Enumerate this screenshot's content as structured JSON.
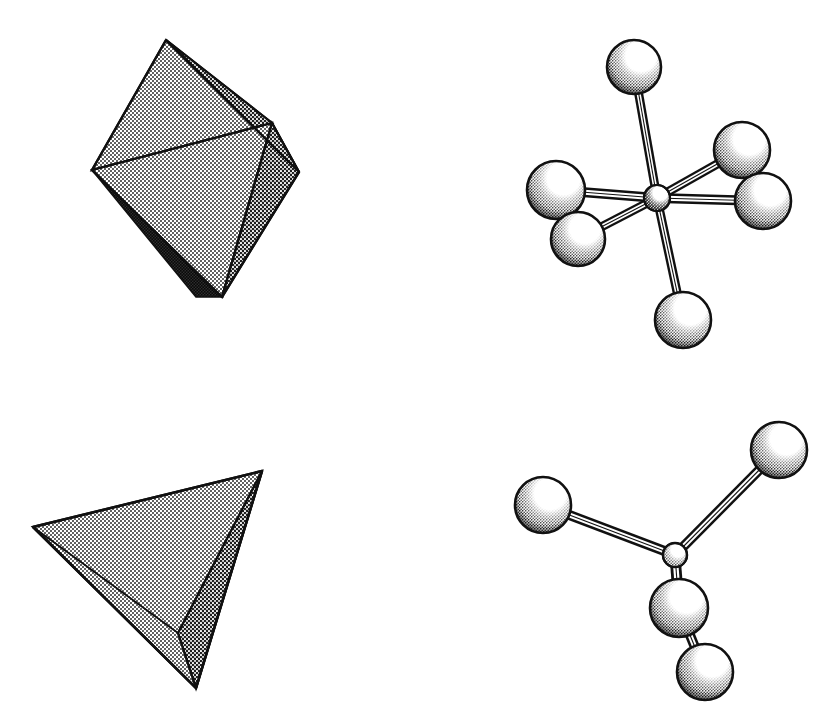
{
  "figure": {
    "background_color": "#ffffff",
    "ink_color": "#111111",
    "stipple_fill_color": "#9a9a9a",
    "light_face_color": "#bdbdbd",
    "mid_face_color": "#a6a6a6",
    "shadow_face_color": "#4a4a4a",
    "sphere_highlight_color": "#ffffff",
    "sphere_shade_color": "#8f8f8f",
    "sphere_dark_color": "#1a1a1a",
    "bond_color": "#ffffff",
    "panels": [
      {
        "id": "octahedron-solid",
        "label": "Octahedron polyhedron",
        "shape_type": "octahedron",
        "position": "top-left",
        "vertices": {
          "top": [
            166,
            40
          ],
          "left": [
            92,
            170
          ],
          "mid": [
            272,
            123
          ],
          "right": [
            299,
            172
          ],
          "bottom": [
            222,
            297
          ]
        },
        "faces": [
          {
            "name": "upper-left-face",
            "points": "166,40 92,170 272,123",
            "tone": "light"
          },
          {
            "name": "upper-right-face",
            "points": "166,40 272,123 299,172",
            "tone": "mid"
          },
          {
            "name": "lower-front-face",
            "points": "92,170 272,123 222,297",
            "tone": "light"
          },
          {
            "name": "lower-right-face",
            "points": "272,123 299,172 222,297",
            "tone": "mid"
          },
          {
            "name": "lower-left-shadow-face",
            "points": "92,170 222,297 104,186",
            "tone": "shadow"
          }
        ]
      },
      {
        "id": "tetrahedron-solid",
        "label": "Tetrahedron polyhedron",
        "shape_type": "tetrahedron",
        "position": "bottom-left",
        "vertices": {
          "left": [
            33,
            527
          ],
          "top_right": [
            262,
            471
          ],
          "bottom": [
            196,
            688
          ],
          "back": [
            178,
            633
          ]
        },
        "faces": [
          {
            "name": "front-top-face",
            "points": "33,527 262,471 196,688",
            "tone": "light"
          },
          {
            "name": "right-face",
            "points": "262,471 196,688 178,633",
            "tone": "mid"
          },
          {
            "name": "bottom-shadow-face",
            "points": "33,527 196,688 178,633",
            "tone": "shadow"
          }
        ]
      },
      {
        "id": "octahedral-molecule",
        "label": "Octahedral ball-and-stick model",
        "shape_type": "octahedral-complex",
        "position": "top-right",
        "central_atom": {
          "name": "central-atom",
          "cx": 657,
          "cy": 198,
          "r": 13
        },
        "ligands": [
          {
            "name": "ligand-top",
            "cx": 634,
            "cy": 67,
            "r": 27
          },
          {
            "name": "ligand-upper-right",
            "cx": 742,
            "cy": 150,
            "r": 28
          },
          {
            "name": "ligand-right",
            "cx": 763,
            "cy": 201,
            "r": 28
          },
          {
            "name": "ligand-left",
            "cx": 556,
            "cy": 190,
            "r": 29
          },
          {
            "name": "ligand-lower-left",
            "cx": 578,
            "cy": 239,
            "r": 27
          },
          {
            "name": "ligand-bottom",
            "cx": 683,
            "cy": 320,
            "r": 28
          }
        ],
        "bond_count": 6
      },
      {
        "id": "tetrahedral-molecule",
        "label": "Tetrahedral ball-and-stick model",
        "shape_type": "tetrahedral-complex",
        "position": "bottom-right",
        "central_atom": {
          "name": "central-atom",
          "cx": 675,
          "cy": 555,
          "r": 12
        },
        "ligands": [
          {
            "name": "ligand-upper-right",
            "cx": 779,
            "cy": 450,
            "r": 28
          },
          {
            "name": "ligand-left",
            "cx": 543,
            "cy": 505,
            "r": 28
          },
          {
            "name": "ligand-front",
            "cx": 679,
            "cy": 608,
            "r": 29
          },
          {
            "name": "ligand-lower",
            "cx": 705,
            "cy": 672,
            "r": 28
          }
        ],
        "bond_count": 4
      }
    ]
  }
}
